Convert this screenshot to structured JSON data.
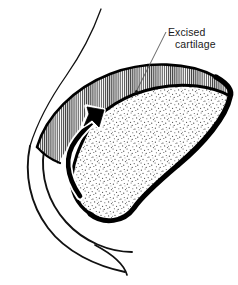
{
  "figure": {
    "background_color": "#ffffff",
    "width": 238,
    "height": 285
  },
  "annotations": {
    "excised_label": {
      "line1": "Excised",
      "line2": "cartilage",
      "text_color": "#1a1a1a",
      "leader_dot": "leader-endpoint-dot"
    }
  },
  "regions": [
    {
      "id": "excised-cartilage-region",
      "name": "Excised cartilage",
      "fill_pattern": "vertical-hatch",
      "fill_color": "#ffffff",
      "hatch_color": "#3a3a3a"
    },
    {
      "id": "remaining-cartilage-region",
      "name": "Remaining cartilage",
      "fill_pattern": "stipple",
      "fill_color": "#ffffff",
      "stipple_color": "#4a4a4a"
    }
  ],
  "strokes": {
    "outline_color": "#000000",
    "contour_color": "#111111",
    "arrow_fill": "#000000",
    "arrow_halo": "#ffffff"
  },
  "icons": {
    "direction_arrow": "curved-up-arrow-icon",
    "leader_line": "leader-line-icon"
  }
}
